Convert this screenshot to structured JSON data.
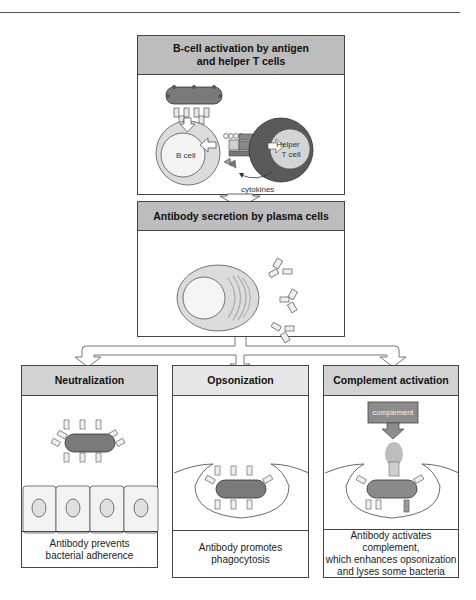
{
  "diagram": {
    "panels": {
      "activation": {
        "title_line1": "B-cell activation by antigen",
        "title_line2": "and helper T cells",
        "labels": {
          "b_cell": "B cell",
          "helper_t_line1": "Helper",
          "helper_t_line2": "T cell",
          "cytokines": "cytokines"
        }
      },
      "secretion": {
        "title": "Antibody secretion by plasma cells"
      },
      "neutralization": {
        "title": "Neutralization",
        "caption_line1": "Antibody prevents",
        "caption_line2": "bacterial adherence"
      },
      "opsonization": {
        "title": "Opsonization",
        "caption_line1": "Antibody promotes",
        "caption_line2": "phagocytosis"
      },
      "complement": {
        "title": "Complement activation",
        "box_label": "complement",
        "caption_line1": "Antibody activates complement,",
        "caption_line2": "which enhances opsonization",
        "caption_line3": "and lyses some bacteria"
      }
    },
    "colors": {
      "header_dark": "#bdbdbd",
      "header_light": "#e6e6e6",
      "bacterium": "#7a7a7a",
      "t_cell_ring": "#5a5a5a",
      "cell_fill": "#d9d9d9",
      "complement_box": "#8c8c8c"
    }
  }
}
